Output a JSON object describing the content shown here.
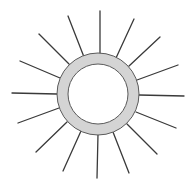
{
  "diagram": {
    "title": "",
    "type": "sun-icon",
    "colors": {
      "ray": "#3a3a3a",
      "ring_fill": "#d4d4d4",
      "ring_stroke": "#5a5a5a",
      "background": "#ffffff",
      "inner_fill": "#ffffff"
    },
    "ring": {
      "cx": 98,
      "cy": 94,
      "outer_r": 41,
      "inner_r": 30
    },
    "rays": [
      {
        "x1": 100,
        "y1": 11,
        "x2": 100,
        "y2": 55
      },
      {
        "x1": 134,
        "y1": 19,
        "x2": 116,
        "y2": 58
      },
      {
        "x1": 160,
        "y1": 37,
        "x2": 129,
        "y2": 66
      },
      {
        "x1": 178,
        "y1": 65,
        "x2": 137,
        "y2": 80
      },
      {
        "x1": 184,
        "y1": 96,
        "x2": 139,
        "y2": 95
      },
      {
        "x1": 176,
        "y1": 128,
        "x2": 136,
        "y2": 112
      },
      {
        "x1": 157,
        "y1": 154,
        "x2": 127,
        "y2": 124
      },
      {
        "x1": 129,
        "y1": 173,
        "x2": 113,
        "y2": 132
      },
      {
        "x1": 97,
        "y1": 178,
        "x2": 98,
        "y2": 134
      },
      {
        "x1": 63,
        "y1": 171,
        "x2": 81,
        "y2": 131
      },
      {
        "x1": 36,
        "y1": 152,
        "x2": 67,
        "y2": 122
      },
      {
        "x1": 18,
        "y1": 123,
        "x2": 59,
        "y2": 108
      },
      {
        "x1": 12,
        "y1": 93,
        "x2": 57,
        "y2": 94
      },
      {
        "x1": 20,
        "y1": 61,
        "x2": 60,
        "y2": 78
      },
      {
        "x1": 39,
        "y1": 34,
        "x2": 69,
        "y2": 64
      },
      {
        "x1": 68,
        "y1": 16,
        "x2": 84,
        "y2": 57
      }
    ]
  }
}
